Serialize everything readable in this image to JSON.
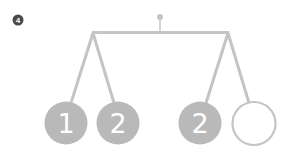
{
  "step_badge": {
    "label": "4",
    "color": "#4a4a4a"
  },
  "colors": {
    "structure": "#c4c4c4",
    "ball_fill": "#b9b9b9",
    "ball_text": "#ffffff",
    "empty_ball_stroke": "#c4c4c4"
  },
  "mobile": {
    "description": "Hanging balance mobile with two arms, each holding two balls",
    "left_arm": {
      "balls": [
        {
          "label": "1",
          "filled": true
        },
        {
          "label": "2",
          "filled": true
        }
      ]
    },
    "right_arm": {
      "balls": [
        {
          "label": "2",
          "filled": true
        },
        {
          "label": "",
          "filled": false
        }
      ]
    }
  }
}
